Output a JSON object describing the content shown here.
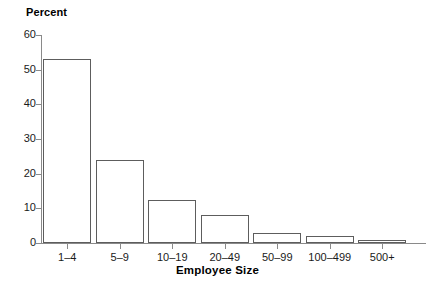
{
  "chart_data": {
    "type": "bar",
    "title": "",
    "subtitle": "",
    "xlabel": "Employee Size",
    "ylabel": "Percent",
    "categories": [
      "1–4",
      "5–9",
      "10–19",
      "20–49",
      "50–99",
      "100–499",
      "500+"
    ],
    "values": [
      53,
      24,
      12.5,
      8,
      2.8,
      2,
      0.8
    ],
    "ylim": [
      0,
      60
    ],
    "yticks": [
      0,
      10,
      20,
      30,
      40,
      50,
      60
    ],
    "ytick_labels": [
      "0",
      "10",
      "20",
      "30",
      "40",
      "50",
      "60"
    ],
    "grid": false,
    "legend": false,
    "legend_position": "none",
    "bar_fill_color": "#ffffff",
    "bar_edge_color": "#5d5d5d",
    "axis_color": "#8a8a8a",
    "background_color": "#ffffff",
    "text_color": "#000000"
  },
  "axes": {
    "y_title": "Percent",
    "x_title": "Employee Size"
  }
}
